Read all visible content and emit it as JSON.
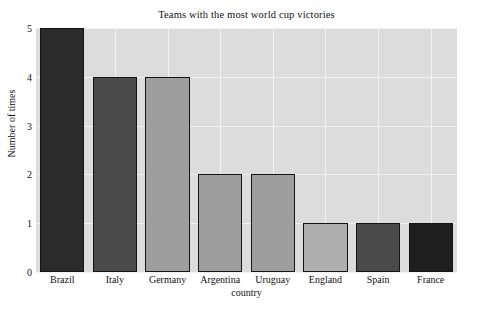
{
  "chart_data": {
    "type": "bar",
    "title": "Teams with the most world cup victories",
    "xlabel": "country",
    "ylabel": "Number of times",
    "categories": [
      "Brazil",
      "Italy",
      "Germany",
      "Argentina",
      "Uruguay",
      "England",
      "Spain",
      "France"
    ],
    "values": [
      5,
      4,
      4,
      2,
      2,
      1,
      1,
      1
    ],
    "bar_colors": [
      "#2b2b2b",
      "#4a4a4a",
      "#9e9e9e",
      "#9e9e9e",
      "#9e9e9e",
      "#aeaeae",
      "#4a4a4a",
      "#1e1e1e"
    ],
    "bar_edge_color": "#141414",
    "ylim": [
      0,
      5
    ],
    "yticks": [
      0,
      1,
      2,
      3,
      4,
      5
    ],
    "ytick_labels": [
      "0",
      "1",
      "2",
      "3",
      "4",
      "5"
    ],
    "grid": true,
    "grid_color": "#f2f2f2",
    "plot_background": "#dcdcdc",
    "figure_background": "#ffffff",
    "legend": null
  }
}
